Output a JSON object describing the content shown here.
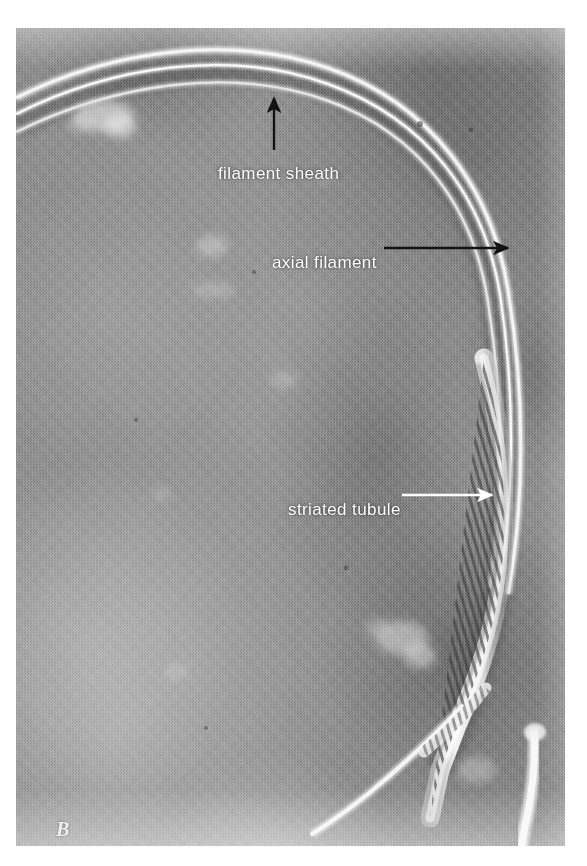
{
  "figure": {
    "panel_letter": "B",
    "kind": "electron-micrograph",
    "background_tone": "#8f8f8f"
  },
  "annotations": [
    {
      "id": "filament-sheath",
      "label": "filament sheath",
      "arrow": {
        "style": "black",
        "direction": "up",
        "from": {
          "x": 274,
          "y": 150
        },
        "to": {
          "x": 274,
          "y": 96
        }
      },
      "label_pos": {
        "x": 202,
        "y": 136
      }
    },
    {
      "id": "axial-filament",
      "label": "axial filament",
      "arrow": {
        "style": "black",
        "direction": "right",
        "from": {
          "x": 384,
          "y": 248
        },
        "to": {
          "x": 510,
          "y": 247
        }
      },
      "label_pos": {
        "x": 256,
        "y": 225
      }
    },
    {
      "id": "striated-tubule",
      "label": "striated tubule",
      "arrow": {
        "style": "white",
        "direction": "right",
        "from": {
          "x": 402,
          "y": 495
        },
        "to": {
          "x": 492,
          "y": 494
        }
      },
      "label_pos": {
        "x": 272,
        "y": 472
      }
    }
  ],
  "colors": {
    "label_text": "#ffffff",
    "black_arrow": "#141414",
    "white_arrow": "#ffffff",
    "page_background": "#ffffff",
    "plate_mid_gray": "#8f8f8f"
  }
}
